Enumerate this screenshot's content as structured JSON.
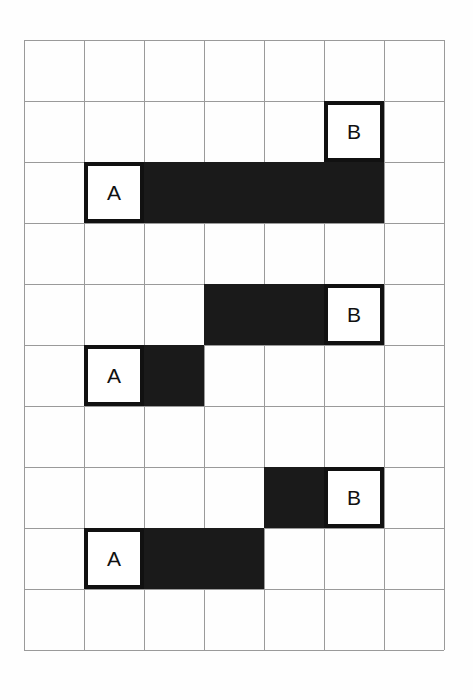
{
  "figure": {
    "background_color": "#fefefe",
    "grid": {
      "columns": 7,
      "rows": 10,
      "cell_width": 60,
      "cell_height": 61,
      "origin_x": 24,
      "origin_y": 40,
      "line_color": "#9a9a9a"
    },
    "bar_color": "#1a1a1a",
    "node_border_color": "#111111",
    "node_fill_color": "#ffffff"
  },
  "groups": [
    {
      "name": "group-1",
      "bars": [
        {
          "name": "bar-1-horizontal",
          "col": 2,
          "row": 2,
          "col_span": 4,
          "row_span": 1
        }
      ],
      "nodes": [
        {
          "name": "node-a-1",
          "label": "A",
          "col": 1,
          "row": 2
        },
        {
          "name": "node-b-1",
          "label": "B",
          "col": 5,
          "row": 1
        }
      ]
    },
    {
      "name": "group-2",
      "bars": [
        {
          "name": "bar-2-upper",
          "col": 3,
          "row": 4,
          "col_span": 2,
          "row_span": 1
        },
        {
          "name": "bar-2-lower",
          "col": 2,
          "row": 5,
          "col_span": 1,
          "row_span": 1
        }
      ],
      "nodes": [
        {
          "name": "node-a-2",
          "label": "A",
          "col": 1,
          "row": 5
        },
        {
          "name": "node-b-2",
          "label": "B",
          "col": 5,
          "row": 4
        }
      ]
    },
    {
      "name": "group-3",
      "bars": [
        {
          "name": "bar-3-upper",
          "col": 4,
          "row": 7,
          "col_span": 1,
          "row_span": 1
        },
        {
          "name": "bar-3-lower",
          "col": 2,
          "row": 8,
          "col_span": 2,
          "row_span": 1
        }
      ],
      "nodes": [
        {
          "name": "node-a-3",
          "label": "A",
          "col": 1,
          "row": 8
        },
        {
          "name": "node-b-3",
          "label": "B",
          "col": 5,
          "row": 7
        }
      ]
    }
  ],
  "labels": {
    "a": "A",
    "b": "B"
  }
}
